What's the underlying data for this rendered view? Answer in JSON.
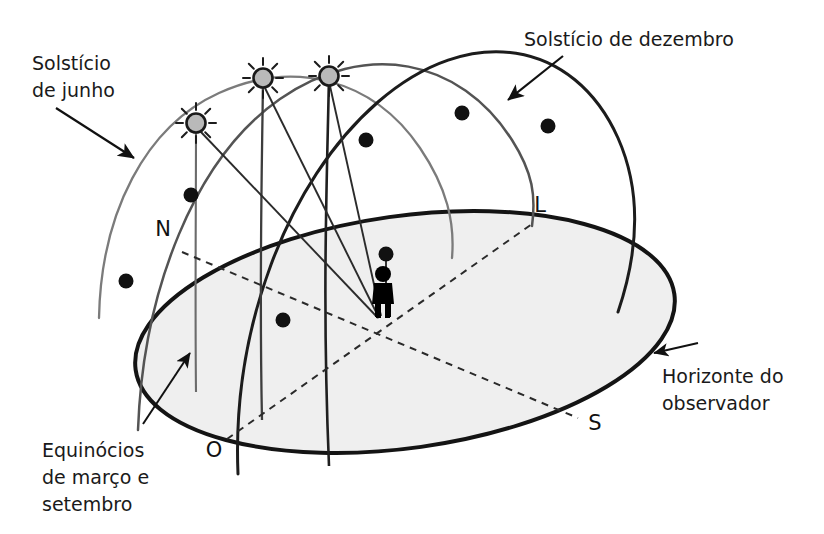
{
  "figure": {
    "title_text": "",
    "background_color": "#ffffff"
  },
  "colors": {
    "horizon_stroke": "#141414",
    "horizon_fill": "#efefef",
    "solstice_june_arc": "#6e6e6e",
    "equinox_arc": "#4a4a4a",
    "solstice_december_arc": "#1e1e1e",
    "sun_fill": "#b9b9b9",
    "sun_stroke": "#1a1a1a",
    "marker_dot": "#111111",
    "dashed_axis": "#2a2a2a",
    "observer": "#000000",
    "text": "#1a1a1a",
    "arrow": "#111111"
  },
  "labels": {
    "solstice_june": {
      "lines": [
        "Solstício",
        "de junho"
      ],
      "line1": "Solstício",
      "line2": "de junho",
      "x": 32,
      "y": 70,
      "anchor": "start"
    },
    "solstice_december": {
      "lines": [
        "Solstício de dezembro"
      ],
      "line1": "Solstício de dezembro",
      "x": 524,
      "y": 46,
      "anchor": "start"
    },
    "equinoxes": {
      "lines": [
        "Equinócios",
        "de março e",
        "setembro"
      ],
      "line1": "Equinócios",
      "line2": "de março e",
      "line3": "setembro",
      "x": 42,
      "y": 457,
      "anchor": "start"
    },
    "horizon": {
      "lines": [
        "Horizonte do",
        "observador"
      ],
      "line1": "Horizonte do",
      "line2": "observador",
      "x": 662,
      "y": 383,
      "anchor": "start"
    }
  },
  "cardinal_points": [
    {
      "id": "north",
      "label": "N",
      "x": 163,
      "y": 236,
      "point_x": 182,
      "point_y": 252
    },
    {
      "id": "east",
      "label": "L",
      "x": 536,
      "y": 212,
      "point_x": 532,
      "point_y": 224
    },
    {
      "id": "west",
      "label": "O",
      "x": 209,
      "y": 457,
      "point_x": 227,
      "point_y": 439
    },
    {
      "id": "south",
      "label": "S",
      "x": 589,
      "y": 430,
      "point_x": 578,
      "point_y": 418
    }
  ],
  "observer": {
    "name": "observador",
    "x": 383,
    "y": 318,
    "height": 52
  },
  "suns": [
    {
      "id": "sun-june",
      "track": "solstice_june",
      "x": 196,
      "y": 123,
      "r": 11
    },
    {
      "id": "sun-equinox",
      "track": "equinox",
      "x": 263,
      "y": 78,
      "r": 11
    },
    {
      "id": "sun-december",
      "track": "solstice_december",
      "x": 329,
      "y": 76,
      "r": 11
    }
  ],
  "markers": [
    {
      "id": "dot-june-1",
      "track": "solstice_june",
      "x": 191,
      "y": 195
    },
    {
      "id": "dot-june-2",
      "track": "solstice_june",
      "x": 126,
      "y": 281
    },
    {
      "id": "dot-equinox-1",
      "track": "equinox",
      "x": 366,
      "y": 140
    },
    {
      "id": "dot-equinox-2",
      "track": "equinox",
      "x": 462,
      "y": 113
    },
    {
      "id": "dot-december-1",
      "track": "solstice_december",
      "x": 548,
      "y": 126
    },
    {
      "id": "dot-december-2",
      "track": "solstice_december",
      "x": 283,
      "y": 320
    },
    {
      "id": "dot-december-3",
      "track": "solstice_december",
      "x": 386,
      "y": 254
    }
  ],
  "horizon_plane": {
    "name": "horizonte-do-observador",
    "center_x": 405,
    "center_y": 332,
    "radius_x": 272,
    "radius_y": 116,
    "rotation_deg": -8
  },
  "axes": [
    {
      "id": "axis-north-south",
      "style": "dashed",
      "from": "north",
      "to": "south"
    },
    {
      "id": "axis-east-west",
      "style": "dashed",
      "from": "east",
      "to": "west"
    }
  ],
  "tracks": [
    {
      "id": "solstice_june",
      "name": "trajetória do solstício de junho",
      "stroke_width": 2.2
    },
    {
      "id": "equinox",
      "name": "trajetória dos equinócios",
      "stroke_width": 2.4
    },
    {
      "id": "solstice_december",
      "name": "trajetória do solstício de dezembro",
      "stroke_width": 2.8
    }
  ],
  "rays": {
    "name": "raios-de-visada-do-observador",
    "count": 4,
    "origin_x": 383,
    "origin_y": 318
  }
}
